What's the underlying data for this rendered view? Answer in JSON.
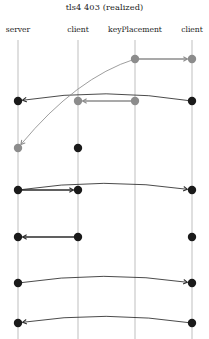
{
  "diagram": {
    "title": "tls4 403 (realized)",
    "type": "message-sequence-chart",
    "width": 209,
    "height": 339,
    "colors": {
      "background": "#ffffff",
      "dark_event": "#1a1a1a",
      "light_event": "#8c8c8c",
      "dark_arrow": "#2b2b2b",
      "light_arrow": "#8c8c8c",
      "lifeline": "#b8b8b8",
      "text": "#1a1a1a"
    },
    "lifelines": [
      {
        "id": "server",
        "label": "server",
        "x": 18,
        "top": 40,
        "bottom": 339
      },
      {
        "id": "client1",
        "label": "client",
        "x": 78,
        "top": 40,
        "bottom": 339
      },
      {
        "id": "keyPlacement",
        "label": "keyPlacement",
        "x": 135,
        "top": 40,
        "bottom": 339
      },
      {
        "id": "client2",
        "label": "client",
        "x": 192,
        "top": 40,
        "bottom": 339
      }
    ],
    "events": [
      {
        "id": "e1",
        "lifeline": "keyPlacement",
        "x": 135,
        "y": 59,
        "shade": "light",
        "r": 4.2
      },
      {
        "id": "e2",
        "lifeline": "client2",
        "x": 192,
        "y": 59,
        "shade": "light",
        "r": 4.2
      },
      {
        "id": "e3",
        "lifeline": "server",
        "x": 18,
        "y": 101,
        "shade": "dark",
        "r": 4.2
      },
      {
        "id": "e4",
        "lifeline": "client1",
        "x": 78,
        "y": 101,
        "shade": "light",
        "r": 4.2
      },
      {
        "id": "e5",
        "lifeline": "keyPlacement",
        "x": 135,
        "y": 101,
        "shade": "light",
        "r": 4.2
      },
      {
        "id": "e6",
        "lifeline": "client2",
        "x": 192,
        "y": 101,
        "shade": "dark",
        "r": 4.2
      },
      {
        "id": "e7",
        "lifeline": "server",
        "x": 18,
        "y": 148,
        "shade": "light",
        "r": 4.2
      },
      {
        "id": "e8",
        "lifeline": "client1",
        "x": 78,
        "y": 148,
        "shade": "dark",
        "r": 4.2
      },
      {
        "id": "e9",
        "lifeline": "server",
        "x": 18,
        "y": 190,
        "shade": "dark",
        "r": 4.2
      },
      {
        "id": "e10",
        "lifeline": "client1",
        "x": 78,
        "y": 190,
        "shade": "dark",
        "r": 4.2
      },
      {
        "id": "e11",
        "lifeline": "client2",
        "x": 192,
        "y": 190,
        "shade": "dark",
        "r": 4.2
      },
      {
        "id": "e12",
        "lifeline": "server",
        "x": 18,
        "y": 237,
        "shade": "dark",
        "r": 4.2
      },
      {
        "id": "e13",
        "lifeline": "client1",
        "x": 78,
        "y": 237,
        "shade": "dark",
        "r": 4.2
      },
      {
        "id": "e14",
        "lifeline": "client2",
        "x": 192,
        "y": 237,
        "shade": "dark",
        "r": 4.2
      },
      {
        "id": "e15",
        "lifeline": "server",
        "x": 18,
        "y": 283,
        "shade": "dark",
        "r": 4.2
      },
      {
        "id": "e16",
        "lifeline": "client2",
        "x": 192,
        "y": 283,
        "shade": "dark",
        "r": 4.2
      },
      {
        "id": "e17",
        "lifeline": "server",
        "x": 18,
        "y": 323,
        "shade": "dark",
        "r": 4.2
      },
      {
        "id": "e18",
        "lifeline": "client2",
        "x": 192,
        "y": 323,
        "shade": "dark",
        "r": 4.2
      }
    ],
    "messages": [
      {
        "id": "m1",
        "from": "keyPlacement",
        "to": "client2",
        "shade": "light",
        "curve": "straight",
        "x1": 135,
        "y1": 59,
        "x2": 192,
        "y2": 59,
        "sag": 0
      },
      {
        "id": "m2",
        "from": "client2",
        "to": "server",
        "shade": "dark",
        "curve": "arc",
        "x1": 192,
        "y1": 101,
        "x2": 18,
        "y2": 101,
        "sag": -14
      },
      {
        "id": "m3",
        "from": "keyPlacement",
        "to": "client1",
        "shade": "light",
        "curve": "straight",
        "x1": 135,
        "y1": 101,
        "x2": 78,
        "y2": 101,
        "sag": 0
      },
      {
        "id": "m4",
        "from": "keyPlacement",
        "to": "server",
        "shade": "light",
        "curve": "arc",
        "x1": 135,
        "y1": 59,
        "x2": 18,
        "y2": 148,
        "sag": -26
      },
      {
        "id": "m5",
        "from": "server",
        "to": "client1",
        "shade": "dark",
        "curve": "straight",
        "x1": 18,
        "y1": 190,
        "x2": 78,
        "y2": 190,
        "sag": 0
      },
      {
        "id": "m6",
        "from": "server",
        "to": "client2",
        "shade": "dark",
        "curve": "arc",
        "x1": 18,
        "y1": 190,
        "x2": 192,
        "y2": 190,
        "sag": -13
      },
      {
        "id": "m7",
        "from": "client1",
        "to": "server",
        "shade": "dark",
        "curve": "straight",
        "x1": 78,
        "y1": 237,
        "x2": 18,
        "y2": 237,
        "sag": 0
      },
      {
        "id": "m8",
        "from": "server",
        "to": "client2",
        "shade": "dark",
        "curve": "arc",
        "x1": 18,
        "y1": 283,
        "x2": 192,
        "y2": 283,
        "sag": -13
      },
      {
        "id": "m9",
        "from": "client2",
        "to": "server",
        "shade": "dark",
        "curve": "arc",
        "x1": 192,
        "y1": 323,
        "x2": 18,
        "y2": 323,
        "sag": -13
      }
    ]
  }
}
